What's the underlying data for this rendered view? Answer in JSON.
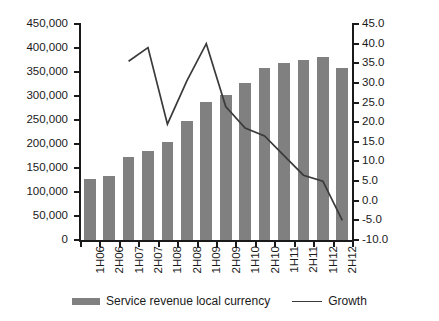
{
  "chart_data": {
    "type": "bar",
    "title": "",
    "subtitle": "",
    "xlabel": "",
    "ylabel": "",
    "categories": [
      "1H06",
      "2H06",
      "1H07",
      "2H07",
      "1H08",
      "2H08",
      "1H09",
      "2H09",
      "1H10",
      "2H10",
      "1H11",
      "2H11",
      "1H12",
      "2H12"
    ],
    "grid": false,
    "legend_position": "bottom",
    "axes": {
      "left": {
        "label": "",
        "min": 0,
        "max": 450000,
        "step": 50000,
        "ticks": [
          "0",
          "50,000",
          "100,000",
          "150,000",
          "200,000",
          "250,000",
          "300,000",
          "350,000",
          "400,000",
          "450,000"
        ],
        "tick_values": [
          0,
          50000,
          100000,
          150000,
          200000,
          250000,
          300000,
          350000,
          400000,
          450000
        ]
      },
      "right": {
        "label": "",
        "min": -10.0,
        "max": 45.0,
        "step": 5.0,
        "ticks": [
          "-10.0",
          "-5.0",
          "0.0",
          "5.0",
          "10.0",
          "15.0",
          "20.0",
          "25.0",
          "30.0",
          "35.0",
          "40.0",
          "45.0"
        ],
        "tick_values": [
          -10.0,
          -5.0,
          0.0,
          5.0,
          10.0,
          15.0,
          20.0,
          25.0,
          30.0,
          35.0,
          40.0,
          45.0
        ]
      }
    },
    "series": [
      {
        "name": "Service revenue local currency",
        "type": "bar",
        "axis": "left",
        "color": "#808080",
        "values": [
          128000,
          134000,
          172000,
          186000,
          205000,
          247000,
          287000,
          302000,
          327000,
          359000,
          368000,
          376000,
          382000,
          358000
        ]
      },
      {
        "name": "Growth",
        "type": "line",
        "axis": "right",
        "color": "#3a3a3a",
        "values": [
          null,
          null,
          35.5,
          39.0,
          19.5,
          30.5,
          40.0,
          24.0,
          18.5,
          16.5,
          11.5,
          6.5,
          5.0,
          -5.0
        ]
      }
    ]
  },
  "legend": {
    "items": [
      {
        "label": "Service revenue local currency",
        "marker": "bar-swatch-icon"
      },
      {
        "label": "Growth",
        "marker": "line-swatch-icon"
      }
    ]
  }
}
